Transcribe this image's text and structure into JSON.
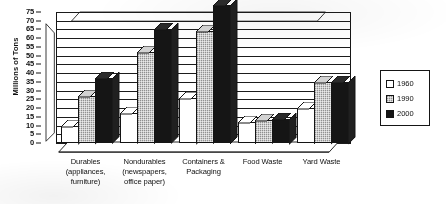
{
  "chart_data": {
    "type": "bar",
    "title": "",
    "xlabel": "",
    "ylabel": "Millions of Tons",
    "ylim": [
      0,
      75
    ],
    "ytick_step": 5,
    "yticks": [
      75,
      70,
      65,
      60,
      55,
      50,
      45,
      40,
      35,
      30,
      25,
      20,
      15,
      10,
      5,
      0
    ],
    "grid": true,
    "legend_position": "right",
    "style": "3d-grouped-bar-grayscale",
    "categories": [
      "Durables (appliances, furniture)",
      "Nondurables (newspapers, office paper)",
      "Containers & Packaging",
      "Food Waste",
      "Yard Waste"
    ],
    "category_label_lines": [
      [
        "Durables",
        "(appliances,",
        "furniture)"
      ],
      [
        "Nondurables",
        "(newspapers,",
        "office paper)"
      ],
      [
        "Containers &",
        "Packaging"
      ],
      [
        "Food Waste"
      ],
      [
        "Yard Waste"
      ]
    ],
    "series": [
      {
        "name": "1960",
        "color": "#ffffff",
        "values": [
          10,
          17,
          26,
          12,
          20
        ]
      },
      {
        "name": "1990",
        "color": "#b9b9b9",
        "values": [
          27,
          52,
          64,
          13,
          35
        ]
      },
      {
        "name": "2000",
        "color": "#151515",
        "values": [
          37,
          65,
          79,
          14,
          35
        ]
      }
    ]
  },
  "axis": {
    "y_label": "Millions of Tons",
    "y_tick_labels": [
      "75",
      "70",
      "65",
      "60",
      "55",
      "50",
      "45",
      "40",
      "35",
      "30",
      "25",
      "20",
      "15",
      "10",
      "5",
      "0"
    ]
  },
  "legend": {
    "entries": [
      {
        "label": "1960",
        "swatch": "white-swatch"
      },
      {
        "label": "1990",
        "swatch": "gray-hatched-swatch"
      },
      {
        "label": "2000",
        "swatch": "black-swatch"
      }
    ]
  }
}
